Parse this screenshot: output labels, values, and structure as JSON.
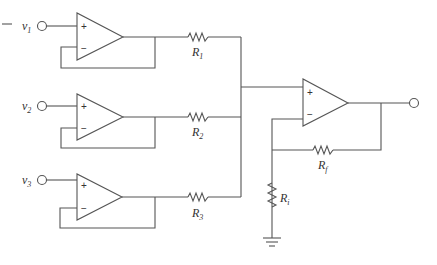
{
  "diagram": {
    "type": "op-amp summing amplifier circuit",
    "stroke_color": "#555555",
    "inputs": [
      {
        "label": "v",
        "sub": "1"
      },
      {
        "label": "v",
        "sub": "2"
      },
      {
        "label": "v",
        "sub": "3"
      }
    ],
    "buffers": [
      {
        "plus": "+",
        "minus": "−"
      },
      {
        "plus": "+",
        "minus": "−"
      },
      {
        "plus": "+",
        "minus": "−"
      }
    ],
    "resistors": [
      {
        "label": "R",
        "sub": "1"
      },
      {
        "label": "R",
        "sub": "2"
      },
      {
        "label": "R",
        "sub": "3"
      }
    ],
    "output_amp": {
      "plus": "+",
      "minus": "−"
    },
    "feedback_resistor": {
      "label": "R",
      "sub": "f"
    },
    "ground_resistor": {
      "label": "R",
      "sub": "i"
    }
  }
}
